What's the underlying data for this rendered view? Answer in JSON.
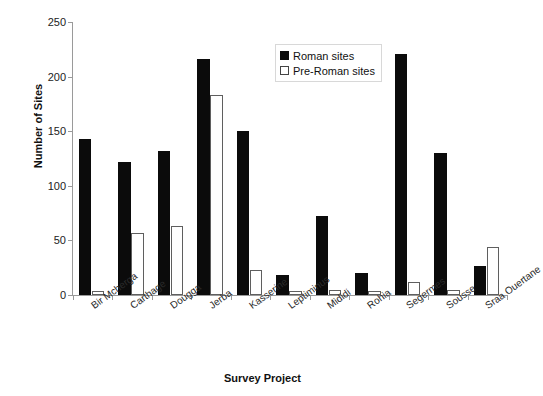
{
  "chart_data": {
    "type": "bar",
    "title": "",
    "xlabel": "Survey Project",
    "ylabel": "Number of Sites",
    "ylim": [
      0,
      250
    ],
    "yticks": [
      0,
      50,
      100,
      150,
      200,
      250
    ],
    "grid": false,
    "legend_position": "top-right",
    "categories": [
      "Bir Mcherga",
      "Carthage",
      "Dougga",
      "Jerba",
      "Kasserine",
      "Leptiminus",
      "Mididi",
      "Rohia",
      "Segermes",
      "Sousse",
      "Sraa Ouertane"
    ],
    "series": [
      {
        "name": "Roman sites",
        "color": "#0b0b0b",
        "values": [
          143,
          122,
          132,
          216,
          150,
          18,
          72,
          20,
          221,
          130,
          27
        ]
      },
      {
        "name": "Pre-Roman sites",
        "color": "#ffffff",
        "values": [
          4,
          57,
          63,
          183,
          23,
          4,
          5,
          4,
          12,
          5,
          44
        ]
      }
    ]
  },
  "axes": {
    "y_title": "Number of Sites",
    "x_title": "Survey Project"
  },
  "legend": {
    "items": [
      {
        "label": "Roman sites",
        "swatch": "filled-square-black"
      },
      {
        "label": "Pre-Roman sites",
        "swatch": "open-square-white"
      }
    ]
  }
}
